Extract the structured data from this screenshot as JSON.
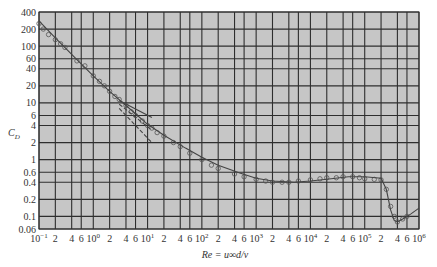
{
  "chart_data": {
    "type": "scatter",
    "title": "",
    "xlabel": "Re = u∞d/ν",
    "ylabel": "C_D",
    "xscale": "log",
    "yscale": "log",
    "xlim": [
      0.1,
      1000000
    ],
    "ylim": [
      0.06,
      400
    ],
    "grid": true,
    "legend": null,
    "x_tick_labels": [
      "10^-1",
      "2",
      "4",
      "6",
      "10^0",
      "2",
      "4",
      "6",
      "10^1",
      "2",
      "4",
      "6",
      "10^2",
      "2",
      "4",
      "6",
      "10^3",
      "2",
      "4",
      "6",
      "10^4",
      "2",
      "4",
      "6",
      "10^5",
      "2",
      "4",
      "6",
      "10^6"
    ],
    "x_ticks": [
      0.1,
      0.2,
      0.4,
      0.6,
      1,
      2,
      4,
      6,
      10,
      20,
      40,
      60,
      100,
      200,
      400,
      600,
      1000,
      2000,
      4000,
      6000,
      10000,
      20000,
      40000,
      60000,
      100000,
      200000,
      400000,
      600000,
      1000000
    ],
    "y_tick_labels": [
      "400",
      "200",
      "100",
      "60",
      "40",
      "20",
      "10",
      "6",
      "4",
      "2",
      "1",
      "0.6",
      "0.4",
      "0.2",
      "0.1",
      "0.06"
    ],
    "y_ticks": [
      400,
      200,
      100,
      60,
      40,
      20,
      10,
      6,
      4,
      2,
      1,
      0.6,
      0.4,
      0.2,
      0.1,
      0.06
    ],
    "series": [
      {
        "name": "experimental data (circles)",
        "kind": "markers",
        "x": [
          0.1,
          0.12,
          0.15,
          0.2,
          0.25,
          0.3,
          0.5,
          0.7,
          1,
          1.3,
          1.6,
          2,
          2.5,
          3,
          4,
          5,
          6,
          8,
          10,
          12,
          15,
          20,
          30,
          40,
          60,
          100,
          150,
          200,
          400,
          600,
          1000,
          1500,
          2000,
          3000,
          4000,
          6000,
          10000,
          15000,
          20000,
          30000,
          40000,
          60000,
          80000,
          100000,
          150000,
          200000,
          250000,
          300000,
          350000,
          400000,
          500000,
          600000
        ],
        "y": [
          250,
          200,
          160,
          130,
          110,
          95,
          55,
          45,
          30,
          24,
          20,
          16,
          13,
          11.5,
          9,
          7,
          6,
          4.8,
          4,
          3.6,
          3,
          2.6,
          2,
          1.7,
          1.3,
          1,
          0.8,
          0.7,
          0.56,
          0.5,
          0.45,
          0.42,
          0.4,
          0.4,
          0.4,
          0.42,
          0.44,
          0.46,
          0.48,
          0.48,
          0.5,
          0.5,
          0.48,
          0.46,
          0.45,
          0.44,
          0.3,
          0.15,
          0.1,
          0.08,
          0.09,
          0.1
        ]
      },
      {
        "name": "empirical fit curve",
        "kind": "line",
        "x": [
          0.1,
          0.2,
          0.5,
          1,
          2,
          5,
          10,
          20,
          50,
          100,
          200,
          500,
          1000,
          2000,
          5000,
          10000,
          20000,
          50000,
          100000,
          200000,
          250000,
          300000,
          350000,
          400000,
          500000,
          700000,
          1000000
        ],
        "y": [
          280,
          140,
          58,
          30,
          16,
          7.5,
          4.2,
          2.7,
          1.6,
          1.1,
          0.8,
          0.58,
          0.47,
          0.42,
          0.4,
          0.42,
          0.45,
          0.5,
          0.5,
          0.47,
          0.3,
          0.13,
          0.085,
          0.08,
          0.09,
          0.11,
          0.14
        ]
      },
      {
        "name": "Stokes asymptote (24/Re)",
        "kind": "dashed",
        "x": [
          3,
          12
        ],
        "y": [
          8,
          2
        ]
      },
      {
        "name": "Oseen asymptote",
        "kind": "dashed",
        "x": [
          3,
          12
        ],
        "y": [
          9.5,
          3.3
        ]
      },
      {
        "name": "upper asymptote",
        "kind": "line",
        "x": [
          3,
          12
        ],
        "y": [
          11,
          5.5
        ]
      }
    ],
    "annotations": []
  },
  "labels": {
    "ylabel_main": "C",
    "ylabel_sub": "D",
    "xlabel_text": "Re = u∞d/ν"
  },
  "style": {
    "plot_bg": "#c6c6c6",
    "grid_color": "#2e2e2e",
    "curve_color": "#444444",
    "marker_color": "#555555"
  }
}
